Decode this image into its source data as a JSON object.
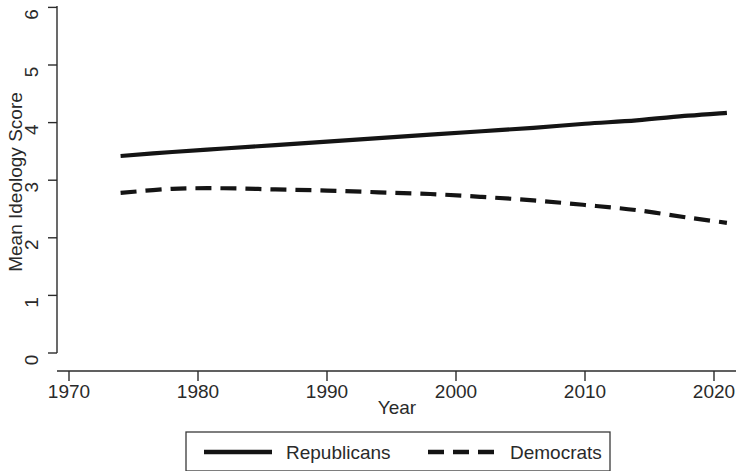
{
  "chart_data": {
    "type": "line",
    "title": "",
    "subtitle": "",
    "xlabel": "Year",
    "ylabel": "Mean Ideology Score",
    "xlim": [
      1968,
      2023
    ],
    "ylim": [
      0,
      6
    ],
    "xticks": [
      1970,
      1980,
      1990,
      2000,
      2010,
      2020
    ],
    "xtick_labels": [
      "1970",
      "1980",
      "1990",
      "2000",
      "2010",
      "2020"
    ],
    "yticks": [
      0,
      1,
      2,
      3,
      4,
      5,
      6
    ],
    "ytick_labels": [
      "0",
      "1",
      "2",
      "3",
      "4",
      "5",
      "6"
    ],
    "grid": false,
    "legend_position": "bottom-center",
    "series": [
      {
        "name": "Republicans",
        "style": "solid",
        "color": "#141414",
        "x": [
          1974,
          1978,
          1982,
          1986,
          1990,
          1994,
          1998,
          2002,
          2006,
          2010,
          2014,
          2018,
          2021
        ],
        "values": [
          3.42,
          3.49,
          3.55,
          3.61,
          3.67,
          3.73,
          3.79,
          3.85,
          3.91,
          3.98,
          4.04,
          4.12,
          4.17
        ]
      },
      {
        "name": "Democrats",
        "style": "dashed",
        "color": "#141414",
        "x": [
          1974,
          1978,
          1982,
          1986,
          1990,
          1994,
          1998,
          2002,
          2006,
          2010,
          2014,
          2018,
          2021
        ],
        "values": [
          2.78,
          2.85,
          2.86,
          2.84,
          2.82,
          2.79,
          2.76,
          2.71,
          2.65,
          2.57,
          2.48,
          2.35,
          2.26
        ]
      }
    ]
  },
  "legend": {
    "entries": [
      {
        "label": "Republicans",
        "style": "solid"
      },
      {
        "label": "Democrats",
        "style": "dashed"
      }
    ]
  },
  "axes": {
    "x_title": "Year",
    "y_title": "Mean Ideology Score"
  }
}
